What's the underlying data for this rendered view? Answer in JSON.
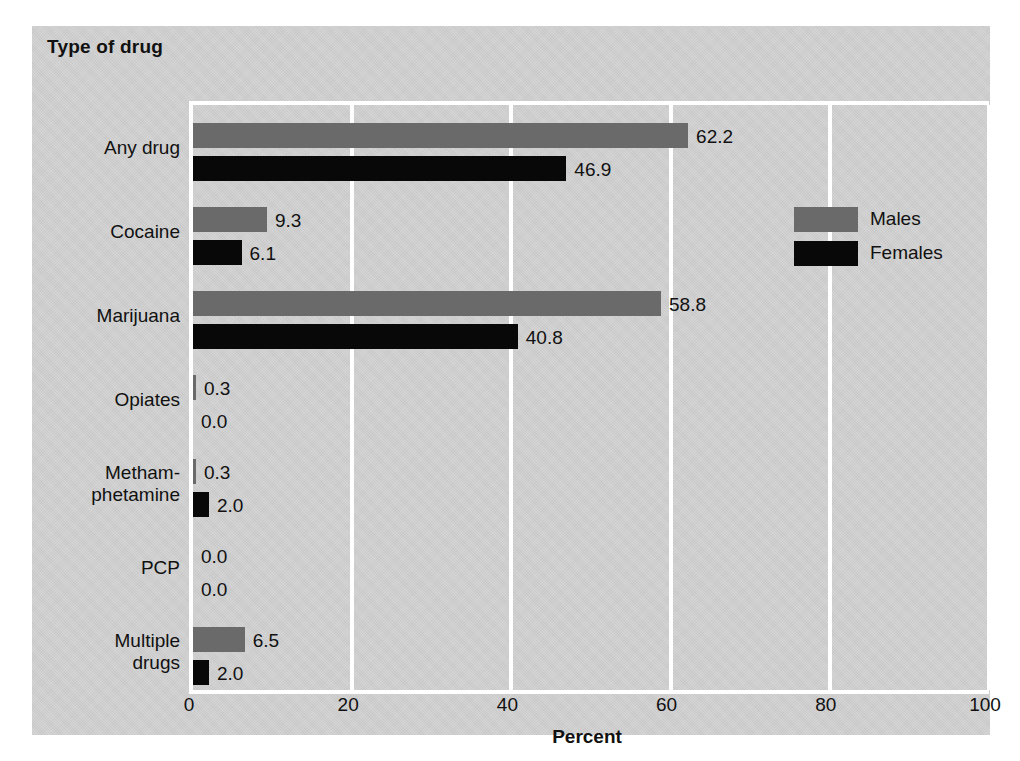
{
  "chart_data": {
    "type": "bar",
    "orientation": "horizontal",
    "title": "Type of drug",
    "xlabel": "Percent",
    "ylabel": "",
    "xlim": [
      0,
      100
    ],
    "xticks": [
      "0",
      "20",
      "40",
      "60",
      "80",
      "100"
    ],
    "grid": true,
    "legend_position": "right-inside-top",
    "categories": [
      "Any drug",
      "Cocaine",
      "Marijuana",
      "Opiates",
      "Metham-\nphetamine",
      "PCP",
      "Multiple\ndrugs"
    ],
    "series": [
      {
        "name": "Males",
        "color": "#6a6a6a",
        "values": [
          62.2,
          9.3,
          58.8,
          0.3,
          0.3,
          0.0,
          6.5
        ],
        "labels": [
          "62.2",
          "9.3",
          "58.8",
          "0.3",
          "0.3",
          "0.0",
          "6.5"
        ]
      },
      {
        "name": "Females",
        "color": "#080808",
        "values": [
          46.9,
          6.1,
          40.8,
          0.0,
          2.0,
          0.0,
          2.0
        ],
        "labels": [
          "46.9",
          "6.1",
          "40.8",
          "0.0",
          "2.0",
          "0.0",
          "2.0"
        ]
      }
    ]
  },
  "category_labels": [
    {
      "line1": "Any drug",
      "line2": ""
    },
    {
      "line1": "Cocaine",
      "line2": ""
    },
    {
      "line1": "Marijuana",
      "line2": ""
    },
    {
      "line1": "Opiates",
      "line2": ""
    },
    {
      "line1": "Metham-",
      "line2": "phetamine"
    },
    {
      "line1": "PCP",
      "line2": ""
    },
    {
      "line1": "Multiple",
      "line2": "drugs"
    }
  ],
  "legend": {
    "items": [
      {
        "label": "Males",
        "color": "#6a6a6a"
      },
      {
        "label": "Females",
        "color": "#080808"
      }
    ]
  },
  "colors": {
    "panel_background": "#cfcfcf",
    "gridline": "#ffffff",
    "males": "#6a6a6a",
    "females": "#080808",
    "text": "#111111"
  }
}
